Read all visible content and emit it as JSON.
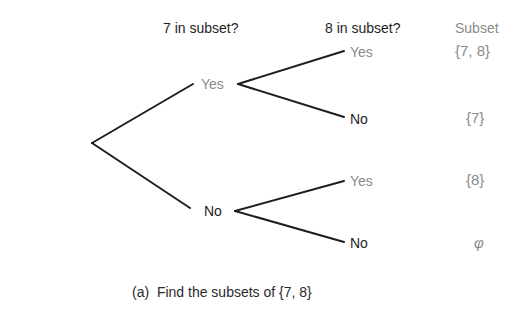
{
  "headers": {
    "level1": "7 in subset?",
    "level2": "8 in subset?",
    "result": "Subset"
  },
  "tree": {
    "level1": [
      {
        "label": "Yes",
        "children": [
          {
            "label": "Yes",
            "subset": "{7, 8}"
          },
          {
            "label": "No",
            "subset": "{7}"
          }
        ]
      },
      {
        "label": "No",
        "children": [
          {
            "label": "Yes",
            "subset": "{8}"
          },
          {
            "label": "No",
            "subset": "φ"
          }
        ]
      }
    ]
  },
  "caption": "(a)  Find the subsets of {7, 8}",
  "colors": {
    "line": "#1e1e1e",
    "yes_text": "#8a8a8a",
    "no_text": "#1e1e1e"
  }
}
